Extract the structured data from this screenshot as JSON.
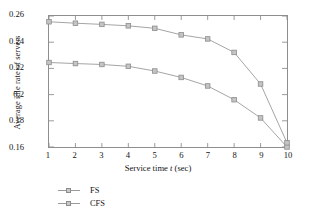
{
  "chart_data": {
    "type": "line",
    "title": "",
    "xlabel": "Service time t (sec)",
    "xlabel_parts": {
      "pre": "Service time ",
      "italic": "t",
      "post": " (sec)"
    },
    "ylabel": "Average idle rate of servers",
    "x": [
      1,
      2,
      3,
      4,
      5,
      6,
      7,
      8,
      9,
      10
    ],
    "xlim": [
      1,
      10
    ],
    "ylim": [
      0.16,
      0.26
    ],
    "xticks": [
      "1",
      "2",
      "3",
      "4",
      "5",
      "6",
      "7",
      "8",
      "9",
      "10"
    ],
    "yticks": [
      "0.16",
      "0.18",
      "0.2",
      "0.22",
      "0.24",
      "0.26"
    ],
    "ytick_values": [
      0.16,
      0.18,
      0.2,
      0.22,
      0.24,
      0.26
    ],
    "grid": false,
    "legend_position": "below-plot-left",
    "marker": "square",
    "series": [
      {
        "name": "FS",
        "color": "#9a9a9a",
        "values": [
          0.2245,
          0.2237,
          0.223,
          0.2216,
          0.218,
          0.2131,
          0.2066,
          0.1961,
          0.1822,
          0.16
        ]
      },
      {
        "name": "CFS",
        "color": "#9a9a9a",
        "values": [
          0.2556,
          0.2545,
          0.2536,
          0.2525,
          0.2506,
          0.2456,
          0.2425,
          0.2322,
          0.2081,
          0.1632
        ]
      }
    ]
  },
  "legend": {
    "items": [
      {
        "label": "FS"
      },
      {
        "label": "CFS"
      }
    ]
  }
}
